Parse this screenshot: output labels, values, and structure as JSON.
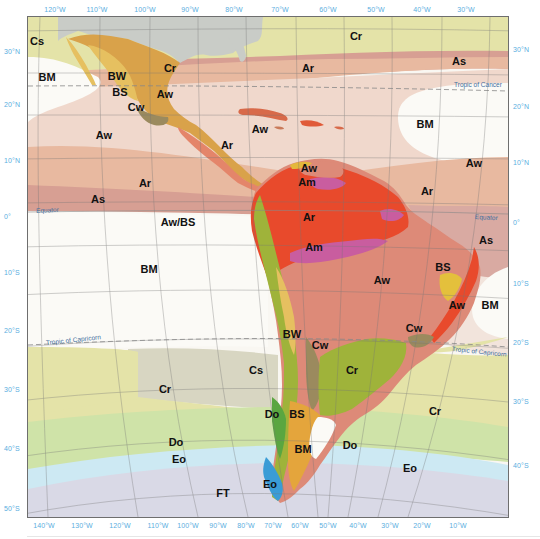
{
  "map": {
    "title": "Climate regions of Latin America and surrounding oceans",
    "colors": {
      "frame": "#6e6e6e",
      "tick_text": "#5aaee0",
      "Cr": "#e4e3a8",
      "Ar": "#e8b9a0",
      "As": "#d79f93",
      "Aw_ocean": "#f0d8cc",
      "BM": "#fbfaf6",
      "Cs": "#d8d6c2",
      "Do": "#cfe3a8",
      "Eo": "#cde9f3",
      "FT": "#d9d9e6",
      "land_Ar": "#e84a2c",
      "land_Am": "#c95d9f",
      "land_Aw": "#dd8a78",
      "land_BW": "#e6c060",
      "land_BS": "#e4a53c",
      "land_Cw": "#9b8a5e",
      "land_Cr": "#9fb33a",
      "land_Do": "#5aa640",
      "land_Eo": "#3a9cd6",
      "north_america_land": "#c9ccc7"
    },
    "top_ticks": [
      "120°W",
      "110°W",
      "100°W",
      "90°W",
      "80°W",
      "70°W",
      "60°W",
      "50°W",
      "40°W",
      "30°W"
    ],
    "bottom_ticks": [
      "140°W",
      "130°W",
      "120°W",
      "110°W",
      "100°W",
      "90°W",
      "80°W",
      "70°W",
      "60°W",
      "50°W",
      "40°W",
      "30°W",
      "20°W",
      "10°W"
    ],
    "left_ticks": [
      "30°N",
      "20°N",
      "10°N",
      "0°",
      "10°S",
      "20°S",
      "30°S",
      "40°S",
      "50°S"
    ],
    "right_ticks": [
      "30°N",
      "20°N",
      "10°N",
      "0°",
      "10°S",
      "20°S",
      "30°S",
      "40°S"
    ],
    "reference_lines": {
      "tropic_cancer": "Tropic of Cancer",
      "equator_left": "Equator",
      "equator_right": "Equator",
      "tropic_capricorn_left": "Tropic of Capricorn",
      "tropic_capricorn_right": "Tropic of Capricorn"
    },
    "zone_labels": [
      {
        "text": "Cs",
        "x": 37,
        "y": 41
      },
      {
        "text": "BM",
        "x": 47,
        "y": 77
      },
      {
        "text": "BW",
        "x": 117,
        "y": 76
      },
      {
        "text": "BS",
        "x": 120,
        "y": 92
      },
      {
        "text": "Cw",
        "x": 136,
        "y": 107
      },
      {
        "text": "Cr",
        "x": 170,
        "y": 68
      },
      {
        "text": "Aw",
        "x": 165,
        "y": 94
      },
      {
        "text": "Cr",
        "x": 356,
        "y": 36
      },
      {
        "text": "Ar",
        "x": 308,
        "y": 68
      },
      {
        "text": "As",
        "x": 459,
        "y": 61
      },
      {
        "text": "BM",
        "x": 425,
        "y": 124
      },
      {
        "text": "Aw",
        "x": 474,
        "y": 163
      },
      {
        "text": "Aw",
        "x": 104,
        "y": 135
      },
      {
        "text": "Aw",
        "x": 260,
        "y": 129
      },
      {
        "text": "Ar",
        "x": 227,
        "y": 145
      },
      {
        "text": "Ar",
        "x": 145,
        "y": 183
      },
      {
        "text": "As",
        "x": 98,
        "y": 199
      },
      {
        "text": "Aw/BS",
        "x": 178,
        "y": 222
      },
      {
        "text": "BM",
        "x": 149,
        "y": 269
      },
      {
        "text": "Aw",
        "x": 309,
        "y": 168
      },
      {
        "text": "Am",
        "x": 307,
        "y": 182
      },
      {
        "text": "Ar",
        "x": 309,
        "y": 217
      },
      {
        "text": "Am",
        "x": 314,
        "y": 247
      },
      {
        "text": "Ar",
        "x": 427,
        "y": 191
      },
      {
        "text": "As",
        "x": 486,
        "y": 240
      },
      {
        "text": "Aw",
        "x": 382,
        "y": 280
      },
      {
        "text": "BS",
        "x": 443,
        "y": 267
      },
      {
        "text": "Aw",
        "x": 457,
        "y": 305
      },
      {
        "text": "BM",
        "x": 490,
        "y": 305
      },
      {
        "text": "Cw",
        "x": 414,
        "y": 328
      },
      {
        "text": "BW",
        "x": 292,
        "y": 334
      },
      {
        "text": "Cw",
        "x": 320,
        "y": 345
      },
      {
        "text": "Cs",
        "x": 256,
        "y": 370
      },
      {
        "text": "Cr",
        "x": 352,
        "y": 370
      },
      {
        "text": "Cr",
        "x": 165,
        "y": 389
      },
      {
        "text": "Cr",
        "x": 435,
        "y": 411
      },
      {
        "text": "Do",
        "x": 272,
        "y": 414
      },
      {
        "text": "BS",
        "x": 297,
        "y": 414
      },
      {
        "text": "BM",
        "x": 303,
        "y": 449
      },
      {
        "text": "Do",
        "x": 350,
        "y": 445
      },
      {
        "text": "Do",
        "x": 176,
        "y": 442
      },
      {
        "text": "Eo",
        "x": 179,
        "y": 459
      },
      {
        "text": "Eo",
        "x": 410,
        "y": 468
      },
      {
        "text": "Eo",
        "x": 270,
        "y": 484
      },
      {
        "text": "FT",
        "x": 223,
        "y": 493
      }
    ]
  }
}
